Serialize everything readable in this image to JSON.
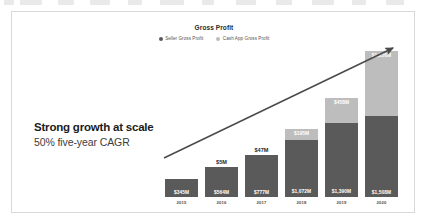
{
  "card": {
    "chart": {
      "title": "Gross Profit",
      "legend": [
        {
          "label": "Seller Gross Profit",
          "color": "#5a5a5a",
          "icon": "legend-dot-icon"
        },
        {
          "label": "Cash App Gross Profit",
          "color": "#bdbdbd",
          "icon": "legend-dot-icon"
        }
      ]
    },
    "headline": {
      "main": "Strong growth at scale",
      "sub": "50% five-year CAGR"
    },
    "arrow": {
      "name": "growth-trend-arrow",
      "color": "#4a4a4a"
    }
  },
  "chart_data": {
    "type": "bar",
    "stacked": true,
    "title": "Gross Profit",
    "xlabel": "",
    "ylabel": "",
    "grid": false,
    "legend_position": "top-center",
    "categories": [
      "2015",
      "2016",
      "2017",
      "2018",
      "2019",
      "2020"
    ],
    "series": [
      {
        "name": "Seller Gross Profit",
        "color": "#5a5a5a",
        "values": [
          345,
          564,
          777,
          1072,
          1390,
          1508
        ],
        "labels": [
          "$345M",
          "$564M",
          "$777M",
          "$1,072M",
          "$1,390M",
          "$1,508M"
        ]
      },
      {
        "name": "Cash App Gross Profit",
        "color": "#bdbdbd",
        "values": [
          0,
          5,
          47,
          195,
          458,
          1226
        ],
        "labels": [
          "",
          "$5M",
          "$47M",
          "$195M",
          "$458M",
          "$1,226M"
        ]
      }
    ],
    "above_bar_labels": [
      "",
      "$5M",
      "$47M",
      "",
      "",
      ""
    ],
    "ylim": [
      0,
      2800
    ],
    "units": "USD millions"
  }
}
